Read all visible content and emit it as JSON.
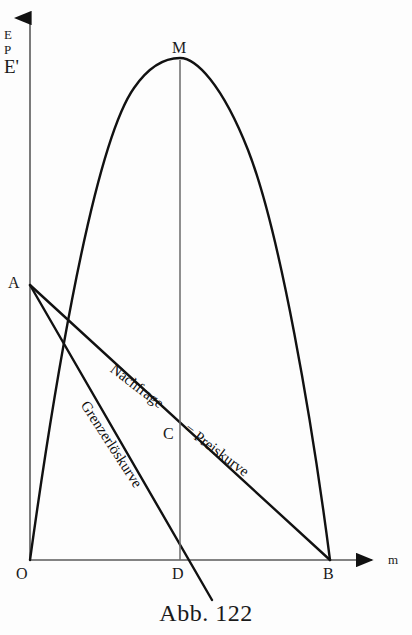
{
  "figure": {
    "caption": "Abb. 122",
    "background_color": "#fdfdfd",
    "ink_color": "#111111"
  },
  "axes": {
    "y_axis": {
      "name": "vertical-axis",
      "labels": [
        "E",
        "P",
        "E'"
      ],
      "label_e": "E",
      "label_p": "P",
      "label_eprime": "E'",
      "arrow": "up",
      "origin_px": [
        30,
        560
      ],
      "top_px": [
        30,
        12
      ]
    },
    "x_axis": {
      "name": "horizontal-axis",
      "label": "m",
      "arrow": "right",
      "origin_px": [
        30,
        560
      ],
      "end_px": [
        380,
        560
      ]
    }
  },
  "points": [
    {
      "id": "O",
      "label": "O",
      "x": 30,
      "y": 560,
      "label_x": 16,
      "label_y": 566
    },
    {
      "id": "A",
      "label": "A",
      "x": 30,
      "y": 285,
      "label_x": 8,
      "label_y": 275
    },
    {
      "id": "M",
      "label": "M",
      "x": 180,
      "y": 60,
      "label_x": 172,
      "label_y": 40
    },
    {
      "id": "C",
      "label": "C",
      "x": 178,
      "y": 434,
      "label_x": 163,
      "label_y": 426
    },
    {
      "id": "D",
      "label": "D",
      "x": 180,
      "y": 560,
      "label_x": 172,
      "label_y": 566
    },
    {
      "id": "B",
      "label": "B",
      "x": 330,
      "y": 560,
      "label_x": 323,
      "label_y": 566
    }
  ],
  "curves": [
    {
      "id": "total-revenue-parabola",
      "name": "Gesamterlöskurve (Parabel)",
      "label": "",
      "from": "O",
      "apex": "M",
      "to": "B"
    },
    {
      "id": "demand-price-line",
      "name": "Nachfrage- = Preiskurve",
      "label_part_1": "Nachfrage-",
      "label_part_2": "= Preiskurve",
      "from": "A",
      "to": "B",
      "rotation_deg": 37
    },
    {
      "id": "marginal-revenue-line",
      "name": "Grenzerlöskurve",
      "label": "Grenzerlöskurve",
      "from": "A",
      "to_px": [
        212,
        600
      ],
      "rotation_deg": 57
    },
    {
      "id": "vertical-md-line",
      "name": "Ordinate MD",
      "label": "",
      "from": "M",
      "to": "D"
    }
  ],
  "curve_labels": {
    "nachfrage": "Nachfrage-",
    "preiskurve": "= Preiskurve",
    "grenzerloes": "Grenzerlöskurve"
  }
}
